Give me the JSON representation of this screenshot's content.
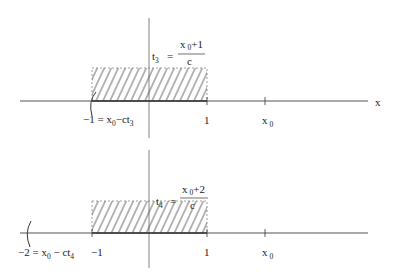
{
  "panels": [
    {
      "time_label": "t",
      "time_sub": "3",
      "eq": "=",
      "numerator_x": "x",
      "numerator_sub": "0",
      "numerator_rest": "+1",
      "denominator": "c",
      "left_label": "−1 = x",
      "left_label_sub": "0",
      "left_label_rest": "−ct",
      "left_label_rest_sub": "3",
      "tick_one": "1",
      "tick_x0": "x",
      "tick_x0_sub": "0",
      "axis_label": "x"
    },
    {
      "time_label": "t",
      "time_sub": "4",
      "eq": "=",
      "numerator_x": "x",
      "numerator_sub": "0",
      "numerator_rest": "+2",
      "denominator": "c",
      "left_label": "−2 = x",
      "left_label_sub": "0",
      "left_label_rest": " − ct",
      "left_label_rest_sub": "4",
      "tick_neg_one": "−1",
      "tick_one": "1",
      "tick_x0": "x",
      "tick_x0_sub": "0"
    }
  ]
}
